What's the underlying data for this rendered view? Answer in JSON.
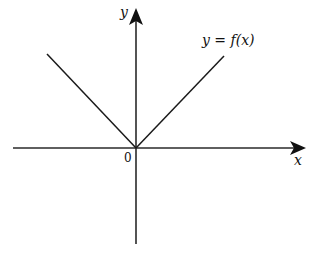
{
  "diagram": {
    "function_label": "y = f(x)",
    "x_axis_label": "x",
    "y_axis_label": "y",
    "origin_label": "0",
    "line_color": "#1a1a1a",
    "axis_color": "#2a2a2a",
    "shape": "V-shaped graph through the origin (absolute value style)"
  }
}
